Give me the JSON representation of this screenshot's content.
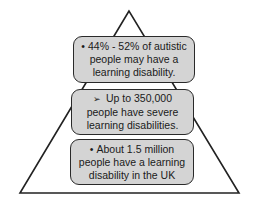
{
  "diagram": {
    "type": "pyramid",
    "colors": {
      "background": "#ffffff",
      "outline": "#222222",
      "box_fill": "#d4d4d4",
      "text": "#1a1a1a"
    },
    "levels": [
      {
        "position": "top",
        "marker": "•",
        "text": "44% - 52% of autistic people may have a learning disability."
      },
      {
        "position": "middle",
        "marker": "➢",
        "text": "Up to 350,000 people have severe learning disabilities."
      },
      {
        "position": "bottom",
        "marker": "•",
        "text": "About 1.5 million people have a learning disability in the UK"
      }
    ]
  }
}
